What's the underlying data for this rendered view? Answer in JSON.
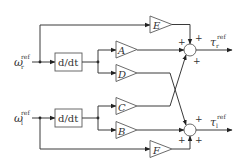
{
  "diagram": {
    "type": "block-diagram",
    "inputs": [
      {
        "id": "omega_r",
        "symbol": "ω",
        "subscript": "r",
        "superscript": "ref"
      },
      {
        "id": "omega_l",
        "symbol": "ω",
        "subscript": "l",
        "superscript": "ref"
      }
    ],
    "outputs": [
      {
        "id": "tau_r",
        "symbol": "τ",
        "subscript": "r",
        "superscript": "ref"
      },
      {
        "id": "tau_l",
        "symbol": "τ",
        "subscript": "l",
        "superscript": "ref"
      }
    ],
    "derivative_blocks": [
      {
        "id": "ddt_top",
        "label": "d/dt"
      },
      {
        "id": "ddt_bottom",
        "label": "d/dt"
      }
    ],
    "gains": [
      {
        "id": "E",
        "label": "E",
        "from": "omega_r",
        "to": "sum_top"
      },
      {
        "id": "A",
        "label": "A",
        "from": "ddt_top",
        "to": "sum_top"
      },
      {
        "id": "D",
        "label": "D",
        "from": "ddt_top",
        "to": "sum_bottom"
      },
      {
        "id": "C",
        "label": "C",
        "from": "ddt_bottom",
        "to": "sum_top"
      },
      {
        "id": "B",
        "label": "B",
        "from": "ddt_bottom",
        "to": "sum_bottom"
      },
      {
        "id": "F",
        "label": "F",
        "from": "omega_l",
        "to": "sum_bottom"
      }
    ],
    "summing_junctions": [
      {
        "id": "sum_top",
        "signs": [
          "+",
          "+",
          "+"
        ],
        "output": "tau_r"
      },
      {
        "id": "sum_bottom",
        "signs": [
          "+",
          "+",
          "+"
        ],
        "output": "tau_l"
      }
    ]
  },
  "labels": {
    "omega": "ω",
    "tau": "τ",
    "ref": "ref",
    "r": "r",
    "l": "l",
    "ddt": "d/dt",
    "plus": "+",
    "A": "A",
    "B": "B",
    "C": "C",
    "D": "D",
    "E": "E",
    "F": "F"
  },
  "colors": {
    "line": "#3a3a3a",
    "block_stroke": "#5a5a5a",
    "background": "#ffffff"
  }
}
